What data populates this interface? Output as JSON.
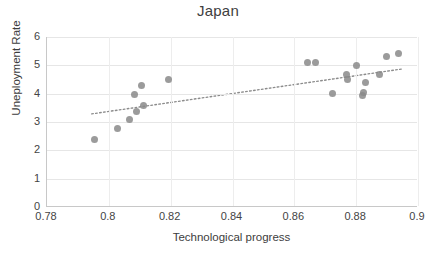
{
  "chart_data": {
    "type": "scatter",
    "title": "Japan",
    "xlabel": "Technological progress",
    "ylabel": "Uneployment Rate",
    "xlim": [
      0.78,
      0.9
    ],
    "ylim": [
      0,
      6
    ],
    "xticks": [
      "0.78",
      "0.8",
      "0.82",
      "0.84",
      "0.86",
      "0.88",
      "0.9"
    ],
    "xtick_values": [
      0.78,
      0.8,
      0.82,
      0.84,
      0.86,
      0.88,
      0.9
    ],
    "yticks": [
      "0",
      "1",
      "2",
      "3",
      "4",
      "5",
      "6"
    ],
    "ytick_values": [
      0,
      1,
      2,
      3,
      4,
      5,
      6
    ],
    "grid": true,
    "legend": false,
    "marker_color": "#8a8a8a",
    "trendline": {
      "style": "dotted",
      "color": "#8c8c8c",
      "x0": 0.7945,
      "y0": 3.27,
      "x1": 0.8955,
      "y1": 4.87
    },
    "points": [
      {
        "x": 0.7955,
        "y": 2.4
      },
      {
        "x": 0.8028,
        "y": 2.78
      },
      {
        "x": 0.8066,
        "y": 3.08
      },
      {
        "x": 0.8083,
        "y": 3.98
      },
      {
        "x": 0.809,
        "y": 3.38
      },
      {
        "x": 0.8105,
        "y": 4.28
      },
      {
        "x": 0.8112,
        "y": 3.6
      },
      {
        "x": 0.8193,
        "y": 4.5
      },
      {
        "x": 0.8643,
        "y": 5.1
      },
      {
        "x": 0.8668,
        "y": 5.1
      },
      {
        "x": 0.8722,
        "y": 4.0
      },
      {
        "x": 0.8768,
        "y": 4.68
      },
      {
        "x": 0.8772,
        "y": 4.5
      },
      {
        "x": 0.88,
        "y": 5.0
      },
      {
        "x": 0.882,
        "y": 3.93
      },
      {
        "x": 0.8824,
        "y": 4.05
      },
      {
        "x": 0.883,
        "y": 4.38
      },
      {
        "x": 0.8877,
        "y": 4.68
      },
      {
        "x": 0.8897,
        "y": 5.3
      },
      {
        "x": 0.8937,
        "y": 5.41
      }
    ]
  }
}
